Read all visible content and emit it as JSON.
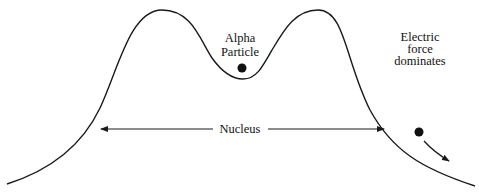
{
  "diagram": {
    "type": "potential-energy-curve",
    "labels": {
      "alpha_line1": "Alpha",
      "alpha_line2": "Particle",
      "electric_line1": "Electric",
      "electric_line2": "force",
      "electric_line3": "dominates",
      "nucleus": "Nucleus"
    },
    "colors": {
      "stroke": "#1a1a1a",
      "background": "#ffffff"
    }
  }
}
